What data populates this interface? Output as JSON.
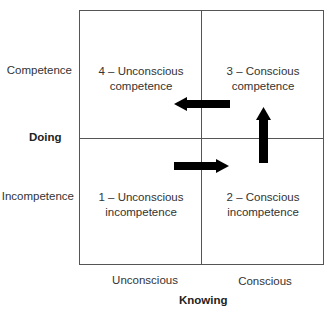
{
  "diagram": {
    "type": "2x2 matrix",
    "y_axis": {
      "title": "Doing",
      "top_label": "Competence",
      "bottom_label": "Incompetence"
    },
    "x_axis": {
      "title": "Knowing",
      "left_label": "Unconscious",
      "right_label": "Conscious"
    },
    "quadrants": [
      {
        "id": 1,
        "position": "bottom-left",
        "line1": "1 – Unconscious",
        "line2": "incompetence"
      },
      {
        "id": 2,
        "position": "bottom-right",
        "line1": "2 – Conscious",
        "line2": "incompetence"
      },
      {
        "id": 3,
        "position": "top-right",
        "line1": "3 – Conscious",
        "line2": "competence"
      },
      {
        "id": 4,
        "position": "top-left",
        "line1": "4 – Unconscious",
        "line2": "competence"
      }
    ],
    "arrows": [
      {
        "from": 1,
        "to": 2,
        "direction": "right"
      },
      {
        "from": 2,
        "to": 3,
        "direction": "up"
      },
      {
        "from": 3,
        "to": 4,
        "direction": "left"
      }
    ],
    "colors": {
      "lines": "#555555",
      "arrows": "#000000",
      "text": "#333333"
    }
  }
}
